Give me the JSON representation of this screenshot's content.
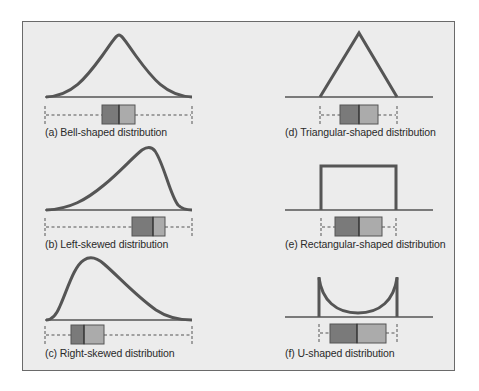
{
  "figure": {
    "panels": [
      {
        "id": "a",
        "caption": "(a) Bell-shaped distribution",
        "shape": "bell"
      },
      {
        "id": "b",
        "caption": "(b) Left-skewed distribution",
        "shape": "left-skewed"
      },
      {
        "id": "c",
        "caption": "(c) Right-skewed distribution",
        "shape": "right-skewed"
      },
      {
        "id": "d",
        "caption": "(d) Triangular-shaped distribution",
        "shape": "triangular"
      },
      {
        "id": "e",
        "caption": "(e) Rectangular-shaped distribution",
        "shape": "rectangular"
      },
      {
        "id": "f",
        "caption": "(f) U-shaped distribution",
        "shape": "u-shaped"
      }
    ],
    "colors": {
      "background": "#ececec",
      "frame": "#6a6a6a",
      "curve": "#555555",
      "box_lower": "#7a7a7a",
      "box_upper": "#ababab",
      "whisker": "#555555"
    }
  }
}
